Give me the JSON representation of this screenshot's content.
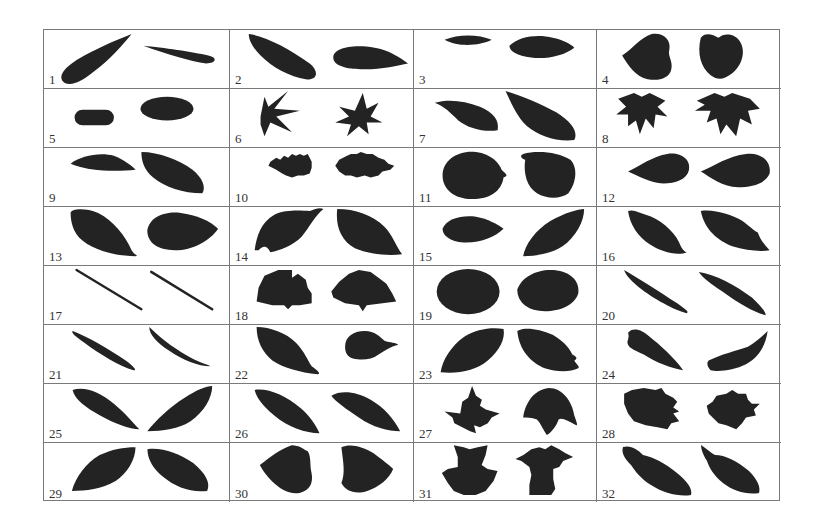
{
  "figure": {
    "rows": 8,
    "columns": 4,
    "leaf_color": "#232323",
    "grid_line_color": "#7a7a7a",
    "cells": [
      {
        "label": "1"
      },
      {
        "label": "2"
      },
      {
        "label": "3"
      },
      {
        "label": "4"
      },
      {
        "label": "5"
      },
      {
        "label": "6"
      },
      {
        "label": "7"
      },
      {
        "label": "8"
      },
      {
        "label": "9"
      },
      {
        "label": "10"
      },
      {
        "label": "11"
      },
      {
        "label": "12"
      },
      {
        "label": "13"
      },
      {
        "label": "14"
      },
      {
        "label": "15"
      },
      {
        "label": "16"
      },
      {
        "label": "17"
      },
      {
        "label": "18"
      },
      {
        "label": "19"
      },
      {
        "label": "20"
      },
      {
        "label": "21"
      },
      {
        "label": "22"
      },
      {
        "label": "23"
      },
      {
        "label": "24"
      },
      {
        "label": "25"
      },
      {
        "label": "26"
      },
      {
        "label": "27"
      },
      {
        "label": "28"
      },
      {
        "label": "29"
      },
      {
        "label": "30"
      },
      {
        "label": "31"
      },
      {
        "label": "32"
      }
    ]
  }
}
